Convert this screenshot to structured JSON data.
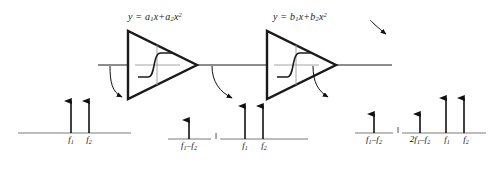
{
  "diagram": {
    "stroke_color": "#1a1a1a",
    "baseline_color": "#7a7a7a",
    "arrow_color": "#111111"
  },
  "stages": [
    {
      "id": "stage-1",
      "formula_plain": "y = a1x+a2x2",
      "formula": {
        "y": "y",
        "equals": " = ",
        "coef1": "a",
        "coef1_sub": "1",
        "var1": "x",
        "plus": "+",
        "coef2": "a",
        "coef2_sub": "2",
        "var2": "x",
        "var2_sup": "2"
      }
    },
    {
      "id": "stage-2",
      "formula_plain": "y = b1x+b2x2",
      "formula": {
        "y": "y",
        "equals": " = ",
        "coef1": "b",
        "coef1_sub": "1",
        "var1": "x",
        "plus": "+",
        "coef2": "b",
        "coef2_sub": "2",
        "var2": "x",
        "var2_sup": "2"
      }
    }
  ],
  "spectra": [
    {
      "id": "input-spectrum",
      "name": "input-spectrum",
      "break_mark": "",
      "tones": [
        {
          "label_main": "f",
          "label_sub": "1",
          "label_tail": ""
        },
        {
          "label_main": "f",
          "label_sub": "2",
          "label_tail": ""
        }
      ]
    },
    {
      "id": "stage1-difference-spectrum",
      "name": "stage1-difference-spectrum",
      "break_mark": "‖",
      "tones": [
        {
          "label_main": "f",
          "label_sub": "1",
          "label_tail": "–f",
          "label_tail_sub": "2"
        }
      ]
    },
    {
      "id": "stage1-output-spectrum",
      "name": "stage1-output-spectrum",
      "break_mark": "",
      "tones": [
        {
          "label_main": "f",
          "label_sub": "1",
          "label_tail": ""
        },
        {
          "label_main": "f",
          "label_sub": "2",
          "label_tail": ""
        }
      ]
    },
    {
      "id": "stage2-difference-spectrum",
      "name": "stage2-difference-spectrum",
      "break_mark": "‖",
      "tones": [
        {
          "label_main": "f",
          "label_sub": "1",
          "label_tail": "–f",
          "label_tail_sub": "2"
        }
      ]
    },
    {
      "id": "stage2-output-spectrum",
      "name": "stage2-output-spectrum",
      "break_mark": "",
      "tones": [
        {
          "label_prefix": "2",
          "label_main": "f",
          "label_sub": "1",
          "label_tail": "–f",
          "label_tail_sub": "2"
        },
        {
          "label_main": "f",
          "label_sub": "1",
          "label_tail": ""
        },
        {
          "label_main": "f",
          "label_sub": "2",
          "label_tail": ""
        }
      ]
    }
  ],
  "labels": {
    "f1": "f1",
    "f2": "f2",
    "f1_minus_f2": "f1-f2",
    "two_f1_minus_f2": "2f1-f2",
    "break": "‖"
  }
}
